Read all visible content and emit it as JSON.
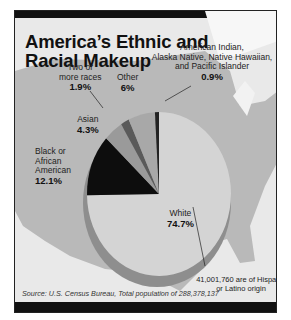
{
  "title_line1": "America’s Ethnic and",
  "title_line2": "Racial Makeup",
  "labels": {
    "two_or_more": {
      "text1": "Two or",
      "text2": "more races",
      "value": "1.9%"
    },
    "other": {
      "text1": "Other",
      "value": "6%"
    },
    "aian": {
      "text1": "American Indian,",
      "text2": "Alaska Native, Native Hawaiian,",
      "text3": "and Pacific Islander",
      "value": "0.9%"
    },
    "asian": {
      "text1": "Asian",
      "value": "4.3%"
    },
    "black": {
      "text1": "Black or",
      "text2": "African",
      "text3": "American",
      "value": "12.1%"
    },
    "white": {
      "text1": "White",
      "value": "74.7%"
    }
  },
  "note": "41,001,760 are of Hispanic or Latino origin",
  "source": "Source: U.S. Census Bureau, Total population of 288,378,137",
  "colors": {
    "white": "#d4d4d4",
    "black": "#0d0d0d",
    "asian": "#9a9a9a",
    "two_or_more": "#5a5a5a",
    "other": "#a8a8a8",
    "aian": "#222222",
    "map": "#b9b9b9",
    "bg": "#ececec"
  },
  "chart_data": {
    "type": "pie",
    "title": "America’s Ethnic and Racial Makeup",
    "categories": [
      "White",
      "Black or African American",
      "Asian",
      "Two or more races",
      "Other",
      "American Indian, Alaska Native, Native Hawaiian, and Pacific Islander"
    ],
    "values": [
      74.7,
      12.1,
      4.3,
      1.9,
      6.0,
      0.9
    ],
    "unit": "%",
    "annotation": "41,001,760 are of Hispanic or Latino origin",
    "source": "U.S. Census Bureau, Total population of 288,378,137"
  }
}
